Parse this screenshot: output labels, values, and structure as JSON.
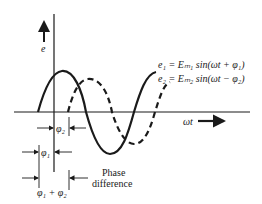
{
  "diagram": {
    "axes": {
      "y_label": "e",
      "x_label": "ωt"
    },
    "equations": {
      "e1": "e₁ = Eₘ₁ sin(ωt + φ₁)",
      "e2": "e₂ = Eₘ₂ sin(ωt − φ₂)"
    },
    "annotations": {
      "phi2": "φ₂",
      "phi1": "φ₁",
      "sum": "φ₁ + φ₂",
      "phase_line1": "Phase",
      "phase_line2": "difference"
    },
    "colors": {
      "ink": "#1a1a1a",
      "background": "#ffffff"
    }
  }
}
